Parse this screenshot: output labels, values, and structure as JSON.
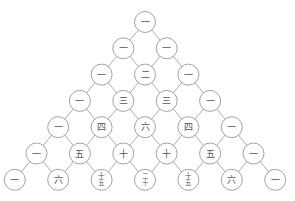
{
  "diagram": {
    "type": "pascal-triangle",
    "layout": {
      "top_x": 145,
      "top_y": 22,
      "dx": 21.7,
      "dy": 26.3,
      "radius": 10.5
    },
    "rows": [
      [
        "一"
      ],
      [
        "一",
        "一"
      ],
      [
        "一",
        "二",
        "一"
      ],
      [
        "一",
        "三",
        "三",
        "一"
      ],
      [
        "一",
        "四",
        "六",
        "四",
        "一"
      ],
      [
        "一",
        "五",
        "十",
        "十",
        "五",
        "一"
      ],
      [
        "一",
        "六",
        "十五",
        "二十",
        "十五",
        "六",
        "一"
      ]
    ],
    "values": [
      [
        1
      ],
      [
        1,
        1
      ],
      [
        1,
        2,
        1
      ],
      [
        1,
        3,
        3,
        1
      ],
      [
        1,
        4,
        6,
        4,
        1
      ],
      [
        1,
        5,
        10,
        10,
        5,
        1
      ],
      [
        1,
        6,
        15,
        20,
        15,
        6,
        1
      ]
    ]
  }
}
